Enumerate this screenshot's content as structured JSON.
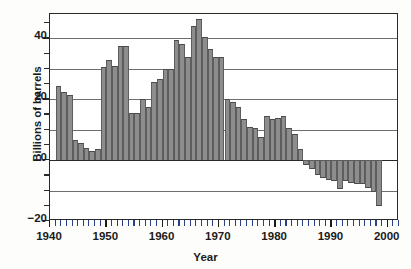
{
  "chart_data": {
    "type": "bar",
    "title": "",
    "xlabel": "Year",
    "ylabel": "Billions of barrels",
    "xlim": [
      1940,
      2002
    ],
    "ylim": [
      -20,
      48
    ],
    "yticks": [
      -20,
      0,
      20,
      40
    ],
    "ytick_labels": [
      "−20",
      "0",
      "20",
      "40"
    ],
    "yticks_minor": [
      -15,
      -10,
      -5,
      5,
      10,
      15,
      25,
      30,
      35,
      45
    ],
    "xticks": [
      1940,
      1950,
      1960,
      1970,
      1980,
      1990,
      2000
    ],
    "xtick_labels": [
      "1940",
      "1950",
      "1960",
      "1970",
      "1980",
      "1990",
      "2000"
    ],
    "xticks_minor_step": 1,
    "gridlines": [
      -10,
      10,
      20,
      30,
      40
    ],
    "grid": true,
    "legend": null,
    "bar_color": "#8d8d8d",
    "bar_edge_color": "#4a4a4a",
    "axis_color": "#2a2a2a",
    "minor_tick_color": "#2a3f86",
    "categories": [
      1941,
      1942,
      1943,
      1944,
      1945,
      1946,
      1947,
      1948,
      1949,
      1950,
      1951,
      1952,
      1953,
      1954,
      1955,
      1956,
      1957,
      1958,
      1959,
      1960,
      1961,
      1962,
      1963,
      1964,
      1965,
      1966,
      1967,
      1968,
      1969,
      1970,
      1971,
      1972,
      1973,
      1974,
      1975,
      1976,
      1977,
      1978,
      1979,
      1980,
      1981,
      1982,
      1983,
      1984,
      1985,
      1986,
      1987,
      1988,
      1989,
      1990,
      1991,
      1992,
      1993,
      1994,
      1995,
      1996,
      1997,
      1998
    ],
    "values": [
      24.5,
      22.5,
      21.5,
      6.5,
      5.5,
      4.0,
      3.0,
      3.5,
      30.5,
      33.0,
      31.0,
      37.5,
      37.5,
      15.5,
      15.5,
      20.0,
      17.5,
      25.5,
      26.5,
      30.0,
      30.0,
      39.5,
      38.0,
      34.0,
      44.0,
      46.5,
      40.5,
      36.5,
      34.0,
      34.0,
      20.0,
      19.0,
      17.5,
      13.5,
      11.0,
      10.5,
      7.5,
      14.5,
      13.5,
      14.0,
      14.5,
      10.5,
      8.5,
      3.5,
      -1.5,
      -3.0,
      -5.0,
      -6.0,
      -6.5,
      -7.0,
      -9.5,
      -7.0,
      -7.5,
      -8.0,
      -8.0,
      -9.0,
      -10.5,
      -15.0
    ],
    "bar_width_years": 1
  }
}
